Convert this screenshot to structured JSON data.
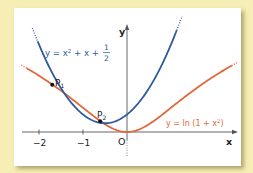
{
  "chart_data": {
    "type": "line",
    "title": "",
    "xlabel": "x",
    "ylabel": "y",
    "origin_label": "O",
    "x_ticks": [
      {
        "value": -2,
        "label": "−2"
      },
      {
        "value": -1,
        "label": "−1"
      }
    ],
    "xlim": [
      -2.4,
      2.6
    ],
    "ylim": [
      -0.5,
      3.3
    ],
    "grid": false,
    "series": [
      {
        "name": "y = x² + x + 1/2",
        "label_main": "y = x",
        "label_sup": "2",
        "label_rest": " + x + ",
        "frac_num": "1",
        "frac_den": "2",
        "color": "#2e5a9c",
        "formula": "x^2 + x + 0.5",
        "x_range": [
          -2.15,
          1.25
        ]
      },
      {
        "name": "y = ln (1 + x²)",
        "label_main": "y = ln (1 + x",
        "label_sup": "2",
        "label_rest": ")",
        "color": "#e0693c",
        "formula": "ln(1 + x^2)",
        "x_range": [
          -2.4,
          2.5
        ]
      }
    ],
    "points": [
      {
        "name": "P1",
        "label": "P",
        "sub": "1",
        "x": -1.7,
        "y": 1.35
      },
      {
        "name": "P2",
        "label": "P",
        "sub": "2",
        "x": -0.61,
        "y": 0.31
      }
    ]
  }
}
